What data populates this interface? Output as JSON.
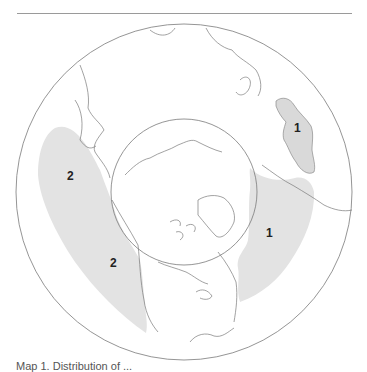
{
  "map": {
    "projection": "north-polar azimuthal",
    "colors": {
      "region_fill": "#e3e3e3",
      "coastline": "#7a7a7a",
      "circle": "#7a7a7a",
      "label": "#222222"
    },
    "regions": [
      {
        "id": "region-1-scandinavia",
        "label": "1"
      },
      {
        "id": "region-1-atlantic",
        "label": "1"
      },
      {
        "id": "region-2-pacific-north",
        "label": "2"
      },
      {
        "id": "region-2-pacific-south",
        "label": "2"
      }
    ]
  },
  "caption": "Map 1. Distribution of ..."
}
